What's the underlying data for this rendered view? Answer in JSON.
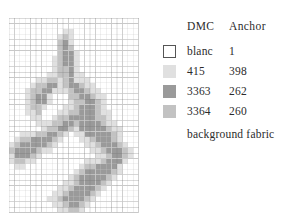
{
  "document": {
    "kind": "cross-stitch pattern chart with color key",
    "background_color": "#ffffff",
    "text_color": "#2b2b2b"
  },
  "chart": {
    "name": "cross-stitch-pattern-grid",
    "grid": {
      "columns": 24,
      "rows": 36,
      "cell_px": 5.4,
      "minor_line_color": "#c9c9c9",
      "major_line_color": "#6e6e6e",
      "major_every": 5,
      "origin_x": 9,
      "origin_y": 18
    },
    "palette": {
      "0": "#ffffff",
      "1": "#e0e0e0",
      "2": "#c2c2c2",
      "3": "#9a9a9a"
    },
    "legend_symbol_for_palette": {
      "0": "blanc",
      "1": "415",
      "2": "3364",
      "3": "3363"
    },
    "cells": [
      "000000000000000000000000",
      "000000000000000000000000",
      "000000000011000000000000",
      "000000000121000000000000",
      "000000000231000000000000",
      "000000000232000000000000",
      "000000000233100000000000",
      "000000001233100000000000",
      "000000001233100000000000",
      "000000001223100000000000",
      "000000011223110000000000",
      "000001122123111000000000",
      "000012233123321100000000",
      "000122331112332110000000",
      "000123310002233211000000",
      "000123310001223321000000",
      "000122100011233321000000",
      "000112000112233321100000",
      "000011001223333322100000",
      "000001112233233332110000",
      "000000122332133333211000",
      "001112233210113333321000",
      "012233332100011233321000",
      "123333321000001123332100",
      "233332110000000112333210",
      "133321000000000011233210",
      "122110000000001112333100",
      "011000000000012233331000",
      "000000000000123333321000",
      "000000000001233333210000",
      "000000000011233332100000",
      "000000000112333321000000",
      "000000001123333210000000",
      "000000011233332100000000",
      "000000001123321000000000",
      "000000000112210000000000"
    ]
  },
  "legend": {
    "name": "color-key",
    "headers": {
      "dmc": "DMC",
      "anchor": "Anchor"
    },
    "rows": [
      {
        "swatch": "blanc-swatch",
        "fill": "#ffffff",
        "border": "#555555",
        "dmc": "blanc",
        "anchor": "1"
      },
      {
        "swatch": "color-415-swatch",
        "fill": "#e0e0e0",
        "border": "none",
        "dmc": "415",
        "anchor": "398"
      },
      {
        "swatch": "color-3363-swatch",
        "fill": "#9a9a9a",
        "border": "none",
        "dmc": "3363",
        "anchor": "262"
      },
      {
        "swatch": "color-3364-swatch",
        "fill": "#c2c2c2",
        "border": "none",
        "dmc": "3364",
        "anchor": "260"
      }
    ],
    "footer": "background fabric"
  }
}
